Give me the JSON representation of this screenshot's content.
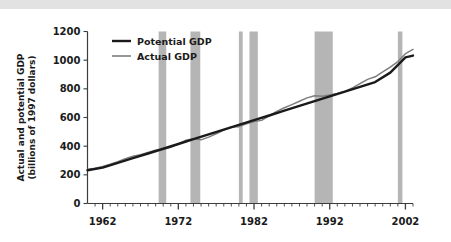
{
  "figure": {
    "background_color": "#ffffff",
    "top_strip_color": "#e2e2e2"
  },
  "chart_data": {
    "type": "line",
    "title": "",
    "xlabel": "",
    "ylabel": "Actual and potential GDP",
    "ylabel_line2": "(billions of 1997 dollars)",
    "xlim": [
      1960,
      2003
    ],
    "ylim": [
      0,
      1200
    ],
    "grid": false,
    "legend_position": "top-left",
    "yticks": [
      0,
      200,
      400,
      600,
      800,
      1000,
      1200
    ],
    "ytick_labels": [
      "0",
      "200",
      "400",
      "600",
      "800",
      "1000",
      "1200"
    ],
    "xticks": [
      1962,
      1972,
      1982,
      1992,
      2002
    ],
    "xtick_labels": [
      "1962",
      "1972",
      "1982",
      "1992",
      "2002"
    ],
    "x_minor_tick_step": 1,
    "colors": {
      "potential": "#1a1a1a",
      "actual": "#7d7d7d",
      "recession_band": "#b5b5b5",
      "axis": "#3c3c3c"
    },
    "series": [
      {
        "name": "Potential GDP",
        "color": "#1a1a1a",
        "x": [
          1960,
          1962,
          1964,
          1966,
          1968,
          1970,
          1972,
          1974,
          1976,
          1978,
          1980,
          1982,
          1984,
          1986,
          1988,
          1990,
          1992,
          1994,
          1996,
          1998,
          2000,
          2002,
          2003
        ],
        "values": [
          232,
          250,
          283,
          316,
          349,
          382,
          415,
          449,
          482,
          515,
          548,
          581,
          614,
          648,
          681,
          714,
          747,
          780,
          813,
          847,
          913,
          1020,
          1032
        ]
      },
      {
        "name": "Actual GDP",
        "color": "#7d7d7d",
        "x": [
          1960,
          1961,
          1962,
          1963,
          1964,
          1965,
          1966,
          1967,
          1968,
          1969,
          1970,
          1971,
          1972,
          1973,
          1974,
          1975,
          1976,
          1977,
          1978,
          1979,
          1980,
          1981,
          1982,
          1983,
          1984,
          1985,
          1986,
          1987,
          1988,
          1989,
          1990,
          1991,
          1992,
          1993,
          1994,
          1995,
          1996,
          1997,
          1998,
          1999,
          2000,
          2001,
          2002,
          2003
        ],
        "values": [
          238,
          246,
          258,
          274,
          292,
          312,
          330,
          341,
          356,
          372,
          378,
          392,
          416,
          441,
          452,
          444,
          463,
          487,
          512,
          534,
          536,
          556,
          572,
          580,
          612,
          643,
          668,
          690,
          713,
          737,
          752,
          748,
          757,
          768,
          782,
          806,
          836,
          866,
          884,
          918,
          952,
          990,
          1045,
          1075
        ]
      }
    ],
    "recession_bands": [
      {
        "start": 1969.4,
        "end": 1970.4
      },
      {
        "start": 1973.6,
        "end": 1974.9
      },
      {
        "start": 1980.0,
        "end": 1980.5
      },
      {
        "start": 1981.4,
        "end": 1982.5
      },
      {
        "start": 1990.0,
        "end": 1992.4
      },
      {
        "start": 2001.0,
        "end": 2001.6
      }
    ]
  },
  "legend": {
    "items": [
      {
        "label": "Potential GDP",
        "color": "#1a1a1a",
        "linewidth": 2.4
      },
      {
        "label": "Actual GDP",
        "color": "#7d7d7d",
        "linewidth": 1.6
      }
    ]
  }
}
